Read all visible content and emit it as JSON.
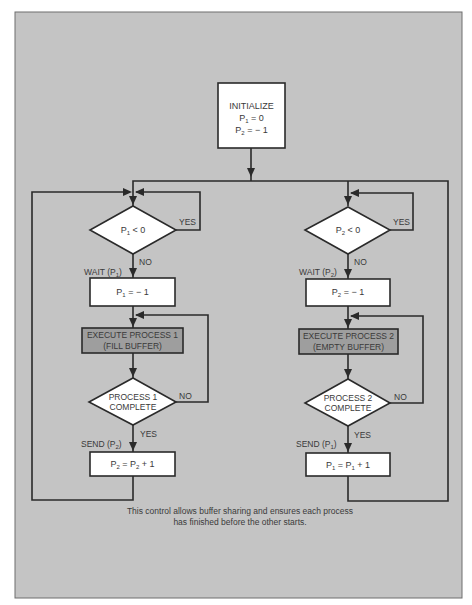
{
  "colors": {
    "panel": "#c4c4c4",
    "panel_border": "#6e6e6e",
    "node_fill": "#ffffff",
    "process_fill": "#9e9e9e",
    "line": "#2a2a2a",
    "text": "#3a3a3a"
  },
  "init": {
    "title": "INITIALIZE",
    "line1": {
      "var": "P",
      "sub": "1",
      "rest": " = 0"
    },
    "line2": {
      "var": "P",
      "sub": "2",
      "rest": " = − 1"
    }
  },
  "left": {
    "decision1": {
      "var": "P",
      "sub": "1",
      "rest": " < 0"
    },
    "yes1": "YES",
    "no1": "NO",
    "wait": {
      "pre": "WAIT (P",
      "sub": "1",
      "post": ")"
    },
    "assign1": {
      "var": "P",
      "sub": "1",
      "rest": " = − 1"
    },
    "process_line1": "EXECUTE PROCESS 1",
    "process_line2": "(FILL BUFFER)",
    "decision2_line1": "PROCESS 1",
    "decision2_line2": "COMPLETE",
    "no2": "NO",
    "yes2": "YES",
    "send": {
      "pre": "SEND (P",
      "sub": "2",
      "post": ")"
    },
    "assign2": {
      "var": "P",
      "sub": "2",
      "mid": " = P",
      "sub2": "2",
      "rest": " + 1"
    }
  },
  "right": {
    "decision1": {
      "var": "P",
      "sub": "2",
      "rest": " < 0"
    },
    "yes1": "YES",
    "no1": "NO",
    "wait": {
      "pre": "WAIT (P",
      "sub": "2",
      "post": ")"
    },
    "assign1": {
      "var": "P",
      "sub": "2",
      "rest": " = − 1"
    },
    "process_line1": "EXECUTE PROCESS 2",
    "process_line2": "(EMPTY BUFFER)",
    "decision2_line1": "PROCESS 2",
    "decision2_line2": "COMPLETE",
    "no2": "NO",
    "yes2": "YES",
    "send": {
      "pre": "SEND (P",
      "sub": "1",
      "post": ")"
    },
    "assign2": {
      "var": "P",
      "sub": "1",
      "mid": " = P",
      "sub2": "1",
      "rest": " + 1"
    }
  },
  "caption": {
    "line1": "This control allows buffer sharing and ensures each process",
    "line2": "has finished before the other starts."
  }
}
